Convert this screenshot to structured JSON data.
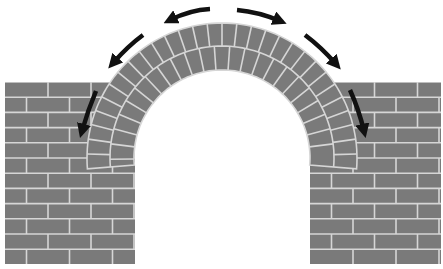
{
  "diagram": {
    "colors": {
      "brick": "#7a7a7a",
      "mortar": "#d6d6d6",
      "arrow": "#111111",
      "background": "#ffffff"
    },
    "parts": [
      {
        "name": "left-wall"
      },
      {
        "name": "right-wall"
      },
      {
        "name": "arch"
      }
    ],
    "arrows": [
      {
        "name": "top-left-arrow",
        "direction": "left"
      },
      {
        "name": "top-right-arrow",
        "direction": "right"
      },
      {
        "name": "upper-left-arrow",
        "direction": "down-left"
      },
      {
        "name": "upper-right-arrow",
        "direction": "down-right"
      },
      {
        "name": "left-wall-arrow",
        "direction": "down"
      },
      {
        "name": "right-wall-arrow",
        "direction": "down"
      }
    ]
  }
}
